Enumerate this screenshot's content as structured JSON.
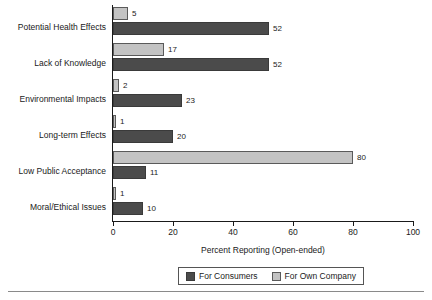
{
  "chart_data": {
    "type": "bar",
    "orientation": "horizontal",
    "title": "",
    "xlabel": "Percent Reporting (Open-ended)",
    "ylabel": "",
    "xlim": [
      0,
      100
    ],
    "xticks": [
      0,
      20,
      40,
      60,
      80,
      100
    ],
    "grid": false,
    "legend_position": "bottom",
    "categories": [
      "Potential Health Effects",
      "Lack of Knowledge",
      "Environmental Impacts",
      "Long-term Effects",
      "Low Public Acceptance",
      "Moral/Ethical Issues"
    ],
    "series": [
      {
        "name": "For Own Company",
        "color": "#c3c3c3",
        "values": [
          5,
          17,
          2,
          1,
          80,
          1
        ]
      },
      {
        "name": "For Consumers",
        "color": "#4b4b4b",
        "values": [
          52,
          52,
          23,
          20,
          11,
          10
        ]
      }
    ]
  },
  "axis": {
    "x_title": "Percent Reporting (Open-ended)",
    "tick_labels": [
      "0",
      "20",
      "40",
      "60",
      "80",
      "100"
    ]
  },
  "legend": {
    "items": [
      {
        "label": "For Consumers",
        "swatch": "dark"
      },
      {
        "label": "For Own Company",
        "swatch": "light"
      }
    ]
  },
  "rows": [
    {
      "label": "Potential Health Effects",
      "own_value": "5",
      "cons_value": "52",
      "own_pct": 5,
      "cons_pct": 52
    },
    {
      "label": "Lack of Knowledge",
      "own_value": "17",
      "cons_value": "52",
      "own_pct": 17,
      "cons_pct": 52
    },
    {
      "label": "Environmental Impacts",
      "own_value": "2",
      "cons_value": "23",
      "own_pct": 2,
      "cons_pct": 23
    },
    {
      "label": "Long-term Effects",
      "own_value": "1",
      "cons_value": "20",
      "own_pct": 1,
      "cons_pct": 20
    },
    {
      "label": "Low Public Acceptance",
      "own_value": "80",
      "cons_value": "11",
      "own_pct": 80,
      "cons_pct": 11
    },
    {
      "label": "Moral/Ethical Issues",
      "own_value": "1",
      "cons_value": "10",
      "own_pct": 1,
      "cons_pct": 10
    }
  ]
}
